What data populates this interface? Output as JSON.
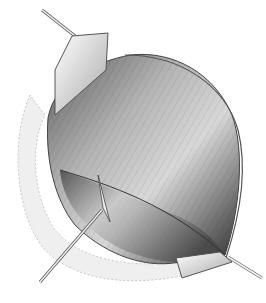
{
  "illustration": {
    "subject": "surgical exposure of muscle with retractors",
    "style": "pencil shading, grayscale",
    "background_color": "#ffffff",
    "colors": {
      "muscle_dark": "#3a3a3a",
      "muscle_mid": "#8c8c8c",
      "muscle_light": "#d6d6d6",
      "fat_tissue": "#e8e8e8",
      "instrument": "#f4f4f4",
      "outline": "#444444"
    },
    "elements": [
      "upper-retractor",
      "lower-right-retractor",
      "probe-instrument",
      "muscle-belly",
      "surrounding-tissue"
    ]
  }
}
